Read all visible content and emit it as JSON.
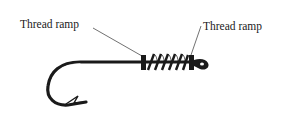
{
  "figure": {
    "labels": [
      {
        "id": "left",
        "text": "Thread ramp"
      },
      {
        "id": "right",
        "text": "Thread ramp"
      }
    ],
    "colors": {
      "ink": "#1a1a1a",
      "background": "#ffffff"
    }
  }
}
